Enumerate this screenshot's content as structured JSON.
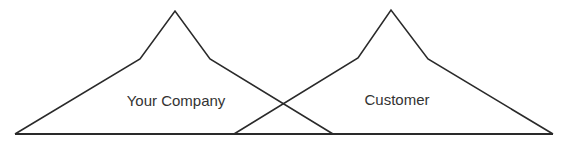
{
  "diagram": {
    "type": "overlapping-mountain-shapes",
    "colors": {
      "stroke": "#2a2a2a",
      "text": "#333333",
      "background": "#ffffff"
    },
    "shapes": [
      {
        "id": "your-company",
        "label": "Your Company",
        "points": [
          [
            15,
            134
          ],
          [
            140,
            59
          ],
          [
            175,
            11
          ],
          [
            210,
            59
          ],
          [
            333,
            134
          ]
        ],
        "label_position": [
          176,
          106
        ]
      },
      {
        "id": "customer",
        "label": "Customer",
        "points": [
          [
            234,
            134
          ],
          [
            358,
            58
          ],
          [
            391,
            10
          ],
          [
            428,
            59
          ],
          [
            553,
            134
          ]
        ],
        "label_position": [
          397,
          105
        ]
      }
    ],
    "baseline": {
      "x1": 15,
      "x2": 553,
      "y": 134
    }
  }
}
